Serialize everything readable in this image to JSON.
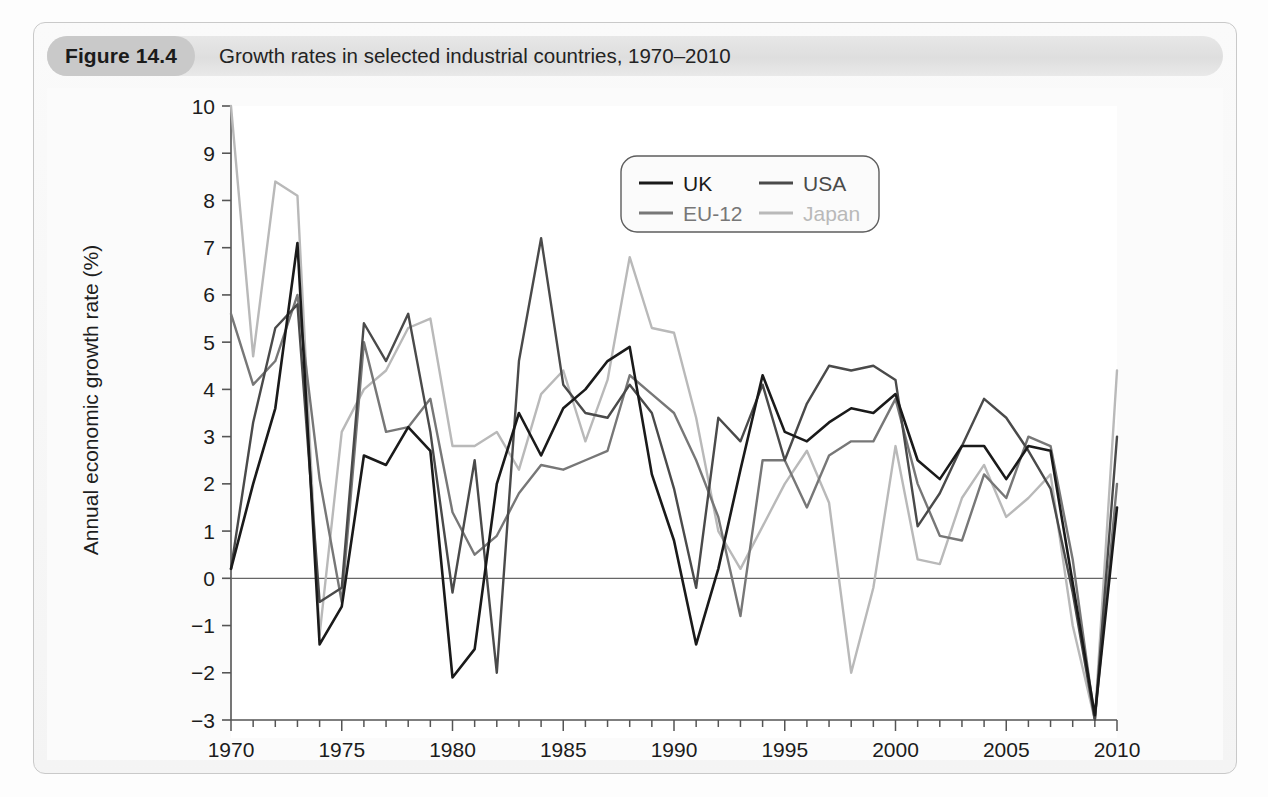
{
  "figure": {
    "badge": "Figure 14.4",
    "title": "Growth rates in selected industrial countries, 1970–2010"
  },
  "colors": {
    "uk": "#1a1a1a",
    "usa": "#4a4a4a",
    "eu12": "#777777",
    "japan": "#b9b9b9",
    "axis": "#555555",
    "zero_line": "#666666",
    "plot_background": "#ffffff",
    "caption_background": "#e3e3e3",
    "badge_background": "#c9c9c9"
  },
  "legend": {
    "position": "top-right-inside",
    "entries": [
      {
        "label": "UK",
        "color_key": "uk"
      },
      {
        "label": "USA",
        "color_key": "usa"
      },
      {
        "label": "EU-12",
        "color_key": "eu12"
      },
      {
        "label": "Japan",
        "color_key": "japan"
      }
    ]
  },
  "axes": {
    "y_label": "Annual economic growth rate (%)",
    "y_ticks": [
      "10",
      "9",
      "8",
      "7",
      "6",
      "5",
      "4",
      "3",
      "2",
      "1",
      "0",
      "−1",
      "−2",
      "−3"
    ],
    "x_ticks": [
      "1970",
      "1975",
      "1980",
      "1985",
      "1990",
      "1995",
      "2000",
      "2005",
      "2010"
    ]
  },
  "chart_data": {
    "type": "line",
    "title": "Growth rates in selected industrial countries, 1970–2010",
    "xlabel": "",
    "ylabel": "Annual economic growth rate (%)",
    "xlim": [
      1970,
      2010
    ],
    "ylim": [
      -3,
      10
    ],
    "ytick_values": [
      10,
      9,
      8,
      7,
      6,
      5,
      4,
      3,
      2,
      1,
      0,
      -1,
      -2,
      -3
    ],
    "xtick_values": [
      1970,
      1975,
      1980,
      1985,
      1990,
      1995,
      2000,
      2005,
      2010
    ],
    "xtick_minor_step": 1,
    "grid": false,
    "zero_line": true,
    "legend": [
      "UK",
      "USA",
      "EU-12",
      "Japan"
    ],
    "x": [
      1970,
      1971,
      1972,
      1973,
      1974,
      1975,
      1976,
      1977,
      1978,
      1979,
      1980,
      1981,
      1982,
      1983,
      1984,
      1985,
      1986,
      1987,
      1988,
      1989,
      1990,
      1991,
      1992,
      1993,
      1994,
      1995,
      1996,
      1997,
      1998,
      1999,
      2000,
      2001,
      2002,
      2003,
      2004,
      2005,
      2006,
      2007,
      2008,
      2009,
      2010
    ],
    "series": [
      {
        "name": "UK",
        "color": "#1a1a1a",
        "values": [
          0.2,
          2.0,
          3.6,
          7.1,
          -1.4,
          -0.6,
          2.6,
          2.4,
          3.2,
          2.7,
          -2.1,
          -1.5,
          2.0,
          3.5,
          2.6,
          3.6,
          4.0,
          4.6,
          4.9,
          2.2,
          0.8,
          -1.4,
          0.2,
          2.3,
          4.3,
          3.1,
          2.9,
          3.3,
          3.6,
          3.5,
          3.9,
          2.5,
          2.1,
          2.8,
          2.8,
          2.1,
          2.8,
          2.7,
          -0.1,
          -2.9,
          1.5
        ]
      },
      {
        "name": "USA",
        "color": "#4a4a4a",
        "values": [
          0.2,
          3.3,
          5.3,
          5.8,
          -0.5,
          -0.2,
          5.4,
          4.6,
          5.6,
          3.1,
          -0.3,
          2.5,
          -2.0,
          4.6,
          7.2,
          4.1,
          3.5,
          3.4,
          4.1,
          3.5,
          1.9,
          -0.2,
          3.4,
          2.9,
          4.1,
          2.5,
          3.7,
          4.5,
          4.4,
          4.5,
          4.2,
          1.1,
          1.8,
          2.8,
          3.8,
          3.4,
          2.7,
          1.9,
          -0.3,
          -3.5,
          3.0
        ]
      },
      {
        "name": "EU-12",
        "color": "#777777",
        "values": [
          5.6,
          4.1,
          4.6,
          6.0,
          2.1,
          -0.5,
          5.0,
          3.1,
          3.2,
          3.8,
          1.4,
          0.5,
          0.9,
          1.8,
          2.4,
          2.3,
          2.5,
          2.7,
          4.3,
          3.9,
          3.5,
          2.5,
          1.3,
          -0.8,
          2.5,
          2.5,
          1.5,
          2.6,
          2.9,
          2.9,
          3.8,
          2.0,
          0.9,
          0.8,
          2.2,
          1.7,
          3.0,
          2.8,
          0.4,
          -4.4,
          2.0
        ]
      },
      {
        "name": "Japan",
        "color": "#b9b9b9",
        "values": [
          10.0,
          4.7,
          8.4,
          8.1,
          -1.2,
          3.1,
          4.0,
          4.4,
          5.3,
          5.5,
          2.8,
          2.8,
          3.1,
          2.3,
          3.9,
          4.4,
          2.9,
          4.2,
          6.8,
          5.3,
          5.2,
          3.4,
          1.0,
          0.2,
          1.1,
          2.0,
          2.7,
          1.6,
          -2.0,
          -0.2,
          2.8,
          0.4,
          0.3,
          1.7,
          2.4,
          1.3,
          1.7,
          2.2,
          -1.0,
          -5.5,
          4.4
        ]
      }
    ]
  }
}
